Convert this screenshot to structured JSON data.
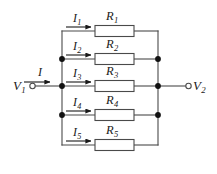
{
  "figure": {
    "name": "parallel-resistor-network",
    "width": 217,
    "height": 174,
    "background": "#ffffff",
    "line_color": "#4a4a4a",
    "text_color": "#1a1a1a"
  },
  "terminals": [
    {
      "id": "v1",
      "label": "V",
      "subscript": "1",
      "x": 22,
      "y": 86,
      "node_x": 48,
      "node_y": 86
    },
    {
      "id": "v2",
      "label": "V",
      "subscript": "2",
      "x": 196,
      "y": 86,
      "node_x": 186,
      "node_y": 86
    }
  ],
  "currents": [
    {
      "id": "i",
      "label": "I",
      "subscript": "",
      "x": 29,
      "y": 72,
      "arrow_x1": 22,
      "arrow_x2": 50,
      "arrow_y": 82
    },
    {
      "id": "i1",
      "label": "I",
      "subscript": "1",
      "x": 75,
      "y": 17,
      "arrow_x1": 66,
      "arrow_x2": 93,
      "arrow_y": 27
    },
    {
      "id": "i2",
      "label": "I",
      "subscript": "2",
      "x": 75,
      "y": 45,
      "arrow_x1": 66,
      "arrow_x2": 93,
      "arrow_y": 55
    },
    {
      "id": "i3",
      "label": "I",
      "subscript": "3",
      "x": 75,
      "y": 72,
      "arrow_x1": 66,
      "arrow_x2": 93,
      "arrow_y": 82
    },
    {
      "id": "i4",
      "label": "I",
      "subscript": "4",
      "x": 75,
      "y": 101,
      "arrow_x1": 66,
      "arrow_x2": 93,
      "arrow_y": 111
    },
    {
      "id": "i5",
      "label": "I",
      "subscript": "5",
      "x": 75,
      "y": 131,
      "arrow_x1": 66,
      "arrow_x2": 93,
      "arrow_y": 141
    }
  ],
  "resistors": [
    {
      "id": "r1",
      "label": "R",
      "subscript": "1",
      "label_x": 111,
      "label_y": 15,
      "box_x": 95,
      "box_y": 26,
      "box_w": 39,
      "box_h": 11,
      "row_y": 31
    },
    {
      "id": "r2",
      "label": "R",
      "subscript": "2",
      "label_x": 111,
      "label_y": 43,
      "box_x": 95,
      "box_y": 54,
      "box_w": 39,
      "box_h": 11,
      "row_y": 59
    },
    {
      "id": "r3",
      "label": "R",
      "subscript": "3",
      "label_x": 111,
      "label_y": 70,
      "box_x": 95,
      "box_y": 81,
      "box_w": 39,
      "box_h": 11,
      "row_y": 86
    },
    {
      "id": "r4",
      "label": "R",
      "subscript": "4",
      "label_x": 111,
      "label_y": 99,
      "box_x": 95,
      "box_y": 110,
      "box_w": 39,
      "box_h": 11,
      "row_y": 115
    },
    {
      "id": "r5",
      "label": "R",
      "subscript": "5",
      "label_x": 111,
      "label_y": 129,
      "box_x": 95,
      "box_y": 140,
      "box_w": 39,
      "box_h": 11,
      "row_y": 145
    }
  ],
  "buses": {
    "left_x": 62,
    "right_x": 158,
    "top_y": 31,
    "bottom_y": 145
  },
  "junction_dots": [
    {
      "id": "left-node-r2",
      "x": 62,
      "y": 59
    },
    {
      "id": "left-node-r3",
      "x": 62,
      "y": 86
    },
    {
      "id": "left-node-r4",
      "x": 62,
      "y": 115
    },
    {
      "id": "right-node-r2",
      "x": 158,
      "y": 59
    },
    {
      "id": "right-node-r3",
      "x": 158,
      "y": 86
    },
    {
      "id": "right-node-r4",
      "x": 158,
      "y": 115
    }
  ]
}
